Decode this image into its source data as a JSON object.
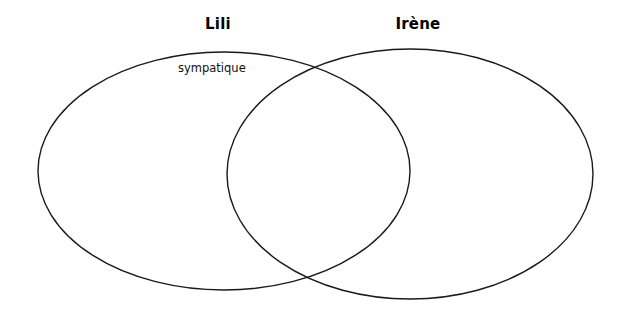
{
  "diagram": {
    "type": "venn",
    "kind": "two-set-venn-diagram",
    "background_color": "#ffffff",
    "stroke_color": "#1a1a1a",
    "text_color": "#000000",
    "sets": [
      {
        "id": "left",
        "title": "Lili",
        "shape": "ellipse",
        "cx": 224,
        "cy": 171,
        "rx": 186,
        "ry": 119
      },
      {
        "id": "right",
        "title": "Irène",
        "shape": "ellipse",
        "cx": 410,
        "cy": 174,
        "rx": 183,
        "ry": 125
      }
    ],
    "items": [
      {
        "label": "sympatique",
        "region": "left-only",
        "x": 178,
        "y": 61
      }
    ],
    "intersection": {
      "label": "",
      "items": []
    }
  }
}
